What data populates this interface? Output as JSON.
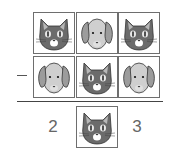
{
  "problem": {
    "operation": "subtraction",
    "operator_symbol": "minus",
    "rows": [
      {
        "cells": [
          "cat",
          "dog",
          "cat"
        ]
      },
      {
        "cells": [
          "dog",
          "cat",
          "dog"
        ]
      }
    ],
    "result": {
      "left_digit": "2",
      "middle_cell": "cat",
      "right_digit": "3"
    }
  },
  "colors": {
    "cat_face": "#6b6b6b",
    "cat_ear_inner": "#b8b8b8",
    "dog_face": "#cfcfcf",
    "dog_ear": "#9c9c9c",
    "box_border": "#6e6e6e",
    "digit_color": "#666666"
  }
}
